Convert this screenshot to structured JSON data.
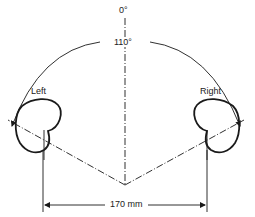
{
  "diagram": {
    "labels": {
      "top_angle": "0°",
      "included_angle": "110°",
      "left_mic": "Left",
      "right_mic": "Right",
      "spacing": "170 mm"
    },
    "colors": {
      "stroke": "#1a1a1a",
      "background": "#ffffff"
    }
  }
}
